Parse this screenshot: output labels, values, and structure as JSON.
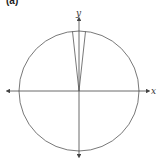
{
  "figure": {
    "cropped_label": "(a)",
    "x_axis_label": "x",
    "y_axis_label": "y",
    "colors": {
      "stroke": "#444444",
      "background": "#ffffff"
    }
  }
}
